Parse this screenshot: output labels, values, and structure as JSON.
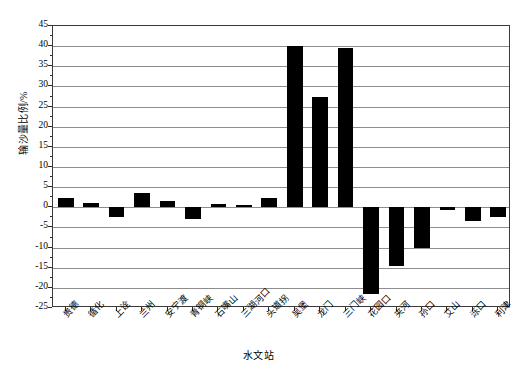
{
  "chart_data": {
    "type": "bar",
    "title": "",
    "subtitle": "",
    "xlabel": "水文站",
    "ylabel": "输沙量比例/%",
    "ylim": [
      -25,
      45
    ],
    "ytick_step": 5,
    "grid": true,
    "legend": "none",
    "bar_color": "#000000",
    "axis_color": "#3a3a3a",
    "grid_color": "#8d8d8d",
    "categories": [
      "贵德",
      "循化",
      "上诠",
      "兰州",
      "安宁渡",
      "青铜峡",
      "石嘴山",
      "三湖河口",
      "头道拐",
      "吴堡",
      "龙门",
      "三门峡",
      "花园口",
      "夹河",
      "孙口",
      "艾山",
      "泺口",
      "利津"
    ],
    "values": [
      2.3,
      1.0,
      -2.3,
      3.5,
      1.5,
      -3.0,
      0.7,
      0.6,
      2.2,
      40.0,
      27.5,
      39.6,
      -21.5,
      -14.5,
      -10.0,
      -0.7,
      -3.5,
      -2.5
    ],
    "ytick_labels": [
      "45",
      "40",
      "35",
      "30",
      "25",
      "20",
      "15",
      "10",
      "5",
      "0",
      "-5",
      "-10",
      "-15",
      "-20",
      "-25"
    ],
    "ytick_values": [
      45,
      40,
      35,
      30,
      25,
      20,
      15,
      10,
      5,
      0,
      -5,
      -10,
      -15,
      -20,
      -25
    ]
  }
}
